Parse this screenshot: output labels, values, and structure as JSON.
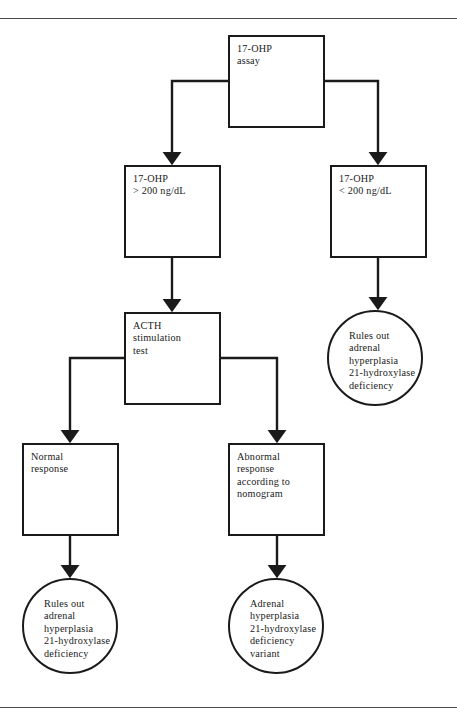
{
  "figure": {
    "domain": "flowchart",
    "background_color": "#ffffff",
    "line_color": "#1a1a1a",
    "rule_color": "#4a4a4a"
  },
  "rules": {
    "top_label": "top-horizontal-rule",
    "bottom_label": "bottom-horizontal-rule"
  },
  "nodes": {
    "assay": {
      "id": "17-ohp-assay",
      "shape": "box",
      "text": "17-OHP\nassay",
      "x": 228,
      "y": 35,
      "w": 97,
      "h": 93
    },
    "high": {
      "id": "17-ohp-high",
      "shape": "box",
      "text": "17-OHP\n> 200 ng/dL",
      "x": 124,
      "y": 165,
      "w": 97,
      "h": 93
    },
    "low": {
      "id": "17-ohp-low",
      "shape": "box",
      "text": "17-OHP\n< 200 ng/dL",
      "x": 330,
      "y": 165,
      "w": 97,
      "h": 93
    },
    "rules_out_right": {
      "id": "rules-out-right",
      "shape": "circle",
      "text": "Rules out\nadrenal\nhyperplasia\n21-hydroxylase\ndeficiency",
      "x": 327,
      "y": 310,
      "w": 96,
      "h": 96
    },
    "acth": {
      "id": "acth-stimulation-test",
      "shape": "box",
      "text": "ACTH\nstimulation\ntest",
      "x": 124,
      "y": 312,
      "w": 97,
      "h": 93
    },
    "normal": {
      "id": "normal-response",
      "shape": "box",
      "text": "Normal\nresponse",
      "x": 22,
      "y": 443,
      "w": 97,
      "h": 93
    },
    "abnormal": {
      "id": "abnormal-response",
      "shape": "box",
      "text": "Abnormal\nresponse\naccording to\nnomogram",
      "x": 228,
      "y": 443,
      "w": 97,
      "h": 93
    },
    "rules_out_left": {
      "id": "rules-out-left",
      "shape": "circle",
      "text": "Rules out\nadrenal\nhyperplasia\n21-hydroxylase\ndeficiency",
      "x": 22,
      "y": 578,
      "w": 96,
      "h": 96
    },
    "variant": {
      "id": "adrenal-hyperplasia-variant",
      "shape": "circle",
      "text": "Adrenal\nhyperplasia\n21-hydroxylase\ndeficiency\nvariant",
      "x": 228,
      "y": 578,
      "w": 96,
      "h": 96
    }
  },
  "connectors": [
    {
      "name": "assay-to-high",
      "path": "M 228 81 L 172 81 L 172 158"
    },
    {
      "name": "assay-to-low",
      "path": "M 325 81 L 378 81 L 378 158"
    },
    {
      "name": "high-to-acth",
      "path": "M 172 258 L 172 305"
    },
    {
      "name": "low-to-rules-out-right",
      "path": "M 378 258 L 378 303"
    },
    {
      "name": "acth-to-normal",
      "path": "M 124 358 L 70 358 L 70 436"
    },
    {
      "name": "acth-to-abnormal",
      "path": "M 221 358 L 277 358 L 277 436"
    },
    {
      "name": "normal-to-rules-out-left",
      "path": "M 70 536 L 70 571"
    },
    {
      "name": "abnormal-to-variant",
      "path": "M 277 536 L 277 571"
    }
  ]
}
